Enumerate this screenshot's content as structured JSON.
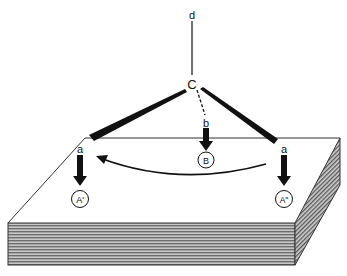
{
  "diagram": {
    "labels": {
      "d": "d",
      "c": "C",
      "b": "b",
      "a_left": "a",
      "a_right": "a",
      "B": "B",
      "A_prime": "A'",
      "A_double_prime": "A\""
    },
    "colors": {
      "ink": "#111111",
      "slab_front": "#9a9a9a",
      "slab_side": "#8c8c8c",
      "background": "#ffffff"
    }
  }
}
